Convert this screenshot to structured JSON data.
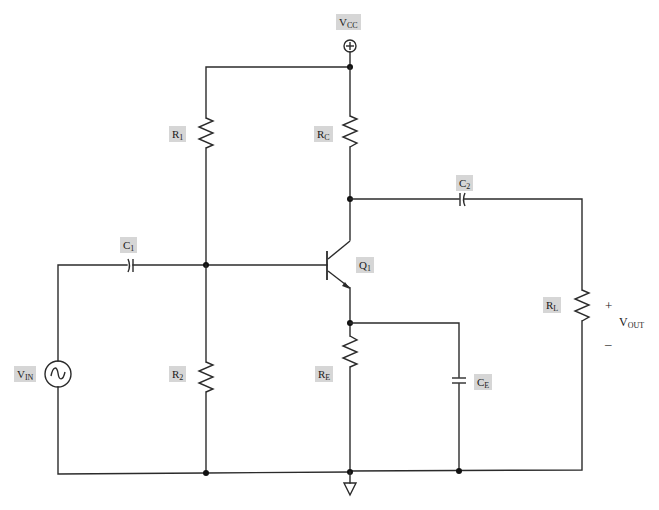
{
  "diagram": {
    "colors": {
      "wire": "#2b2b2b",
      "label_background": "#d6d6d6",
      "source_fill": "#e6e6e6"
    },
    "supply": {
      "label": "V",
      "sub": "CC",
      "symbol": "⊕"
    },
    "components": {
      "R1": {
        "label": "R",
        "sub": "1"
      },
      "R2": {
        "label": "R",
        "sub": "2"
      },
      "RC": {
        "label": "R",
        "sub": "C"
      },
      "RE": {
        "label": "R",
        "sub": "E"
      },
      "RL": {
        "label": "R",
        "sub": "L"
      },
      "C1": {
        "label": "C",
        "sub": "1"
      },
      "C2": {
        "label": "C",
        "sub": "2"
      },
      "CE": {
        "label": "C",
        "sub": "E"
      },
      "Q1": {
        "label": "Q",
        "sub": "1"
      },
      "VIN": {
        "label": "V",
        "sub": "IN",
        "symbol": "~"
      }
    },
    "output": {
      "label": "V",
      "sub": "OUT",
      "plus": "+",
      "minus": "–"
    },
    "ground": {
      "symbol": "▽"
    }
  }
}
